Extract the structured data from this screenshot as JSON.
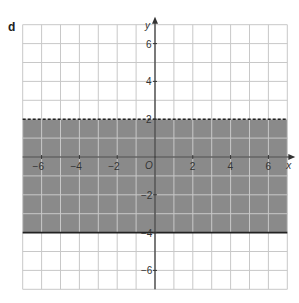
{
  "part_label": "d",
  "graph": {
    "x_axis_label": "x",
    "y_axis_label": "y",
    "origin_label": "O",
    "x_range": [
      -7,
      7
    ],
    "y_range": [
      -7,
      7
    ],
    "grid_step": 1,
    "x_ticks": [
      "-6",
      "-4",
      "-2",
      "2",
      "4",
      "6"
    ],
    "y_ticks": [
      "6",
      "4",
      "2",
      "-2",
      "-4",
      "-6"
    ],
    "region": {
      "description": "-4 <= y < 2",
      "upper_boundary": {
        "y": 2,
        "style": "dashed"
      },
      "lower_boundary": {
        "y": -4,
        "style": "solid"
      },
      "fill_color": "#8a8a8a"
    },
    "grid_color": "#c8c8c8",
    "axis_color": "#333333"
  }
}
